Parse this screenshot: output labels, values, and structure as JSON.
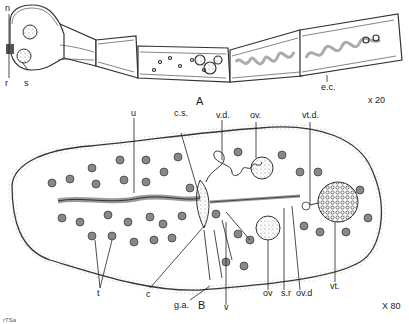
{
  "figure": {
    "panel_a": {
      "label": "A",
      "magnification": "x 20",
      "labels": {
        "n": "n",
        "r": "r",
        "s": "s",
        "ec": "e.c."
      }
    },
    "panel_b": {
      "label": "B",
      "magnification": "X 80",
      "labels": {
        "u": "u",
        "cs": "c.s.",
        "vd": "v.d.",
        "ov_top": "ov.",
        "vtd": "vt.d.",
        "t": "t",
        "c": "c",
        "ga": "g.a.",
        "v": "v",
        "ov": "ov",
        "sr": "s.r",
        "ovd": "ov.d",
        "vt": "vt."
      }
    },
    "signature": "rTSa"
  }
}
